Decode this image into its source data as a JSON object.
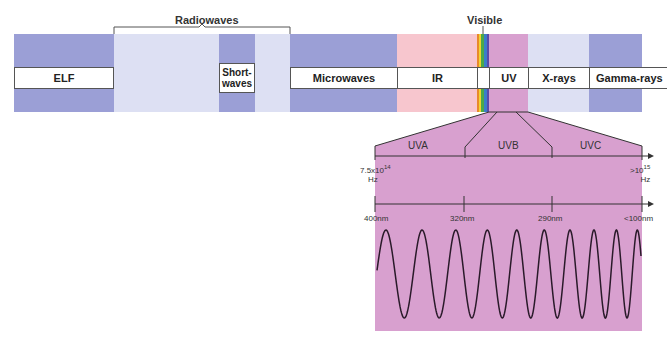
{
  "bands": [
    {
      "id": "elf",
      "label": "ELF",
      "color": "#9b9fd6"
    },
    {
      "id": "radio",
      "label": "",
      "color": "#dde0f3"
    },
    {
      "id": "shortwaves",
      "label": "Short-\nwaves",
      "color": "#9b9fd6"
    },
    {
      "id": "microwaves",
      "label": "Microwaves",
      "color": "#9b9fd6"
    },
    {
      "id": "ir",
      "label": "IR",
      "color": "#f7c6ce"
    },
    {
      "id": "uv",
      "label": "UV",
      "color": "#d8a0cf"
    },
    {
      "id": "xrays",
      "label": "X-rays",
      "color": "#dde0f3"
    },
    {
      "id": "gamma",
      "label": "Gamma-rays",
      "color": "#9b9fd6"
    }
  ],
  "group_labels": {
    "radiowaves": "Radiowaves",
    "visible": "Visible"
  },
  "uv_detail": {
    "subbands": [
      "UVA",
      "UVB",
      "UVC"
    ],
    "frequency_axis": {
      "start": "7.5x10",
      "start_exp": "14",
      "start_unit": "Hz",
      "end": ">10",
      "end_exp": "15",
      "end_unit": "Hz"
    },
    "wavelength_axis": [
      "400nm",
      "320nm",
      "290nm",
      "<100nm"
    ],
    "panel_color": "#d8a0cf"
  }
}
